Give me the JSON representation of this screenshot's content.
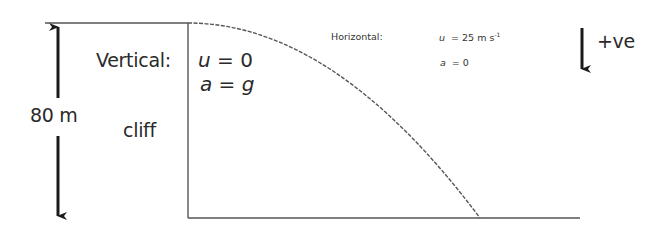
{
  "diagram": {
    "height_label": "80 m",
    "cliff_label": "cliff",
    "vertical": {
      "title": "Vertical:",
      "u_symbol": "u",
      "u_eq": " = 0",
      "a_symbol": "a",
      "a_eq": " = ",
      "a_value": "g"
    },
    "horizontal": {
      "title": "Horizontal:",
      "u_symbol": "u",
      "u_eq": "  = 25 m s",
      "u_unit_exp": "-1",
      "a_symbol": "a",
      "a_eq": "  = 0"
    },
    "direction_label": "+ve",
    "colors": {
      "line": "#555555",
      "arrow": "#1a1a1a",
      "text": "#2a2a2a"
    }
  }
}
